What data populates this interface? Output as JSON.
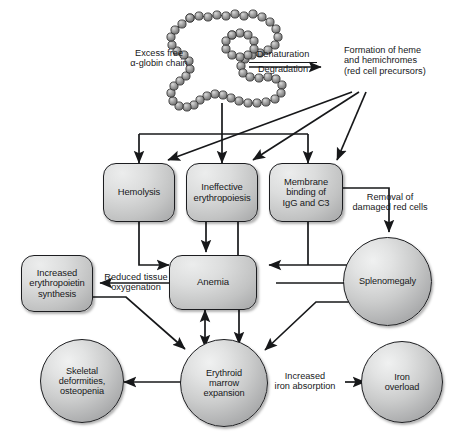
{
  "figure": {
    "background_color": "#ffffff",
    "stroke_color": "#17181a",
    "node_fill_light": "#eceded",
    "node_fill_dark": "#9a9b9c"
  },
  "nodes": [
    {
      "id": "hemolysis",
      "shape": "box",
      "label": "Hemolysis"
    },
    {
      "id": "ineffective",
      "shape": "box",
      "label": "Ineffective\nerythropoiesis"
    },
    {
      "id": "membrane",
      "shape": "box",
      "label": "Membrane\nbinding of\nIgG and C3"
    },
    {
      "id": "epo",
      "shape": "box",
      "label": "Increased\nerythropoietin\nsynthesis"
    },
    {
      "id": "anemia",
      "shape": "box",
      "label": "Anemia"
    },
    {
      "id": "splenomegaly",
      "shape": "circle",
      "label": "Splenomegaly"
    },
    {
      "id": "skeletal",
      "shape": "circle",
      "label": "Skeletal\ndeformities,\nosteopenia"
    },
    {
      "id": "erythroid",
      "shape": "circle",
      "label": "Erythroid\nmarrow\nexpansion"
    },
    {
      "id": "iron",
      "shape": "circle",
      "label": "Iron\noverload"
    }
  ],
  "annotations": {
    "excess_globin": "Excess free\nα-globin chain",
    "denaturation": "Denaturation",
    "degradation": "Degradation",
    "heme_formation": "Formation of heme\nand hemichromes\n(red cell precursors)",
    "removal": "Removal of\ndamaged red cells",
    "reduced_oxygenation": "Reduced tissue\noxygenation",
    "iron_absorption": "Increased\niron absorption"
  },
  "edges": [
    {
      "from": "globin-chain",
      "to": "distribution-bus",
      "style": "plain"
    },
    {
      "from": "distribution-bus",
      "to": "hemolysis",
      "style": "arrow"
    },
    {
      "from": "distribution-bus",
      "to": "ineffective",
      "style": "arrow"
    },
    {
      "from": "distribution-bus",
      "to": "membrane",
      "style": "arrow"
    },
    {
      "from": "heme_formation",
      "to": "hemolysis",
      "style": "arrow"
    },
    {
      "from": "heme_formation",
      "to": "ineffective",
      "style": "arrow"
    },
    {
      "from": "heme_formation",
      "to": "membrane",
      "style": "arrow"
    },
    {
      "from": "hemolysis",
      "to": "anemia",
      "style": "arrow"
    },
    {
      "from": "ineffective",
      "to": "anemia",
      "style": "arrow"
    },
    {
      "from": "ineffective",
      "to": "anemia",
      "style": "plain"
    },
    {
      "from": "membrane",
      "to": "splenomegaly",
      "style": "arrow",
      "label": "Removal of damaged red cells"
    },
    {
      "from": "membrane",
      "to": "anemia-spleen-bus",
      "style": "double-arrow"
    },
    {
      "from": "anemia",
      "to": "splenomegaly",
      "style": "arrow"
    },
    {
      "from": "anemia",
      "to": "epo",
      "style": "arrow",
      "label": "Reduced tissue oxygenation"
    },
    {
      "from": "anemia",
      "to": "erythroid",
      "style": "double-arrow"
    },
    {
      "from": "anemia",
      "to": "erythroid",
      "style": "arrow"
    },
    {
      "from": "epo",
      "to": "erythroid",
      "style": "arrow"
    },
    {
      "from": "splenomegaly",
      "to": "erythroid",
      "style": "arrow"
    },
    {
      "from": "erythroid",
      "to": "skeletal",
      "style": "arrow"
    },
    {
      "from": "erythroid",
      "to": "iron",
      "style": "arrow",
      "label": "Increased iron absorption"
    }
  ]
}
